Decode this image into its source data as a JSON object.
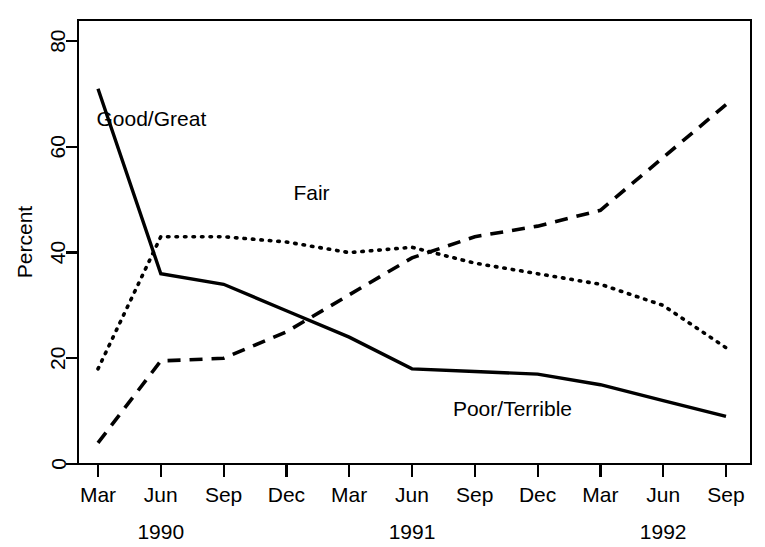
{
  "chart_data": {
    "type": "line",
    "title": "",
    "xlabel": "",
    "ylabel": "Percent",
    "ylim": [
      0,
      84
    ],
    "xlim": [
      0,
      10
    ],
    "grid": false,
    "legend": "inline-annotations",
    "categories": [
      "Mar",
      "Jun",
      "Sep",
      "Dec",
      "Mar",
      "Jun",
      "Sep",
      "Dec",
      "Mar",
      "Jun",
      "Sep"
    ],
    "x_tick_labels": [
      "Mar",
      "Jun",
      "Sep",
      "Dec",
      "Mar",
      "Jun",
      "Sep",
      "Dec",
      "Mar",
      "Jun",
      "Sep"
    ],
    "y_tick_labels": [
      "0",
      "20",
      "40",
      "60",
      "80"
    ],
    "y_ticks": [
      0,
      20,
      40,
      60,
      80
    ],
    "year_groups": [
      {
        "label": "1990",
        "center_tick_index": 1
      },
      {
        "label": "1991",
        "center_tick_index": 5
      },
      {
        "label": "1992",
        "center_tick_index": 9
      }
    ],
    "series": [
      {
        "name": "Good/Great",
        "style": "solid",
        "label": "Good/Great",
        "label_x_index": 0.85,
        "label_y_value": 64,
        "values": [
          71,
          36,
          34,
          29,
          24,
          18,
          17.5,
          17,
          15,
          12,
          9
        ]
      },
      {
        "name": "Fair",
        "style": "dotted",
        "label": "Fair",
        "label_x_index": 3.4,
        "label_y_value": 50,
        "values": [
          18,
          43,
          43,
          42,
          40,
          41,
          38,
          36,
          34,
          30,
          22
        ]
      },
      {
        "name": "Poor/Terrible",
        "style": "dashed",
        "label": "Poor/Terrible",
        "label_x_index": 6.6,
        "label_y_value": 9,
        "values": [
          4,
          19.5,
          20,
          25,
          32,
          39,
          43,
          45,
          48,
          58,
          68
        ]
      }
    ],
    "colors": {
      "axis": "#000000",
      "series": "#000000",
      "background": "#ffffff"
    }
  }
}
